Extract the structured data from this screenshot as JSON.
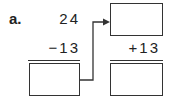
{
  "problem": {
    "label": "a.",
    "minuend": "24",
    "subtrahend": "−13",
    "addend": "+13"
  },
  "boxes": {
    "difference_answer": "",
    "sum_answer": ""
  }
}
